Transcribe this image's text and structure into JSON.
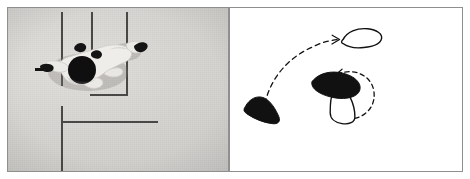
{
  "figure": {
    "panel_count": 2,
    "background_color": "#ffffff"
  },
  "left_panel": {
    "name": "overhead-photograph",
    "kind": "photo",
    "border_color": "#8f8f8f",
    "floor_color": "#d6d4d1",
    "line_color": "#4a4846",
    "description": "Top-down greyscale photograph of a person lying or crouching on a light grey floor with dark painted court lines",
    "floor_lines": [
      {
        "name": "vertical-line-1",
        "orientation": "vertical",
        "x": 53,
        "y": 4,
        "length": 74
      },
      {
        "name": "vertical-line-2",
        "orientation": "vertical",
        "x": 83,
        "y": 4,
        "length": 44
      },
      {
        "name": "vertical-line-3",
        "orientation": "vertical",
        "x": 118,
        "y": 4,
        "length": 84
      },
      {
        "name": "horizontal-line-1",
        "orientation": "horizontal",
        "x": 82,
        "y": 86,
        "length": 38
      },
      {
        "name": "vertical-line-4",
        "orientation": "vertical",
        "x": 53,
        "y": 98,
        "length": 65
      },
      {
        "name": "horizontal-line-2",
        "orientation": "horizontal",
        "x": 53,
        "y": 113,
        "length": 97
      }
    ],
    "subject": {
      "name": "person",
      "body_color": "#f2f0ee",
      "head_color": "#111111",
      "shadow_color": "#b4b1ae",
      "pose": "overhead view, dark round head, pale limbs spread, dark shoes at the extremities"
    }
  },
  "right_panel": {
    "name": "foot-placement-schematic",
    "kind": "diagram",
    "border_color": "#8f8f8f",
    "background_color": "#ffffff",
    "stroke_color": "#000000",
    "description": "Line drawing showing three foot outlines and two dashed motion arcs with arrowheads",
    "elements": [
      {
        "name": "foot-outline-top",
        "type": "foot",
        "fill": "outline",
        "label": "unfilled foot outline, upper right"
      },
      {
        "name": "foot-filled-left",
        "type": "foot",
        "fill": "solid",
        "label": "solid black foot, lower left"
      },
      {
        "name": "foot-filled-center",
        "type": "foot",
        "fill": "solid",
        "label": "solid black foot, centre"
      },
      {
        "name": "foot-outline-center",
        "type": "foot",
        "fill": "outline",
        "label": "unfilled foot outline below the centre solid foot"
      },
      {
        "name": "motion-arc-long",
        "type": "dashed-arc",
        "arrowhead": "end",
        "direction": "from lower-left to upper-right",
        "label": "long dashed travel arc"
      },
      {
        "name": "motion-arc-rotation",
        "type": "dashed-arc",
        "arrowhead": "end",
        "direction": "counter-clockwise around the centre foot",
        "label": "short dashed rotation arc"
      }
    ]
  }
}
